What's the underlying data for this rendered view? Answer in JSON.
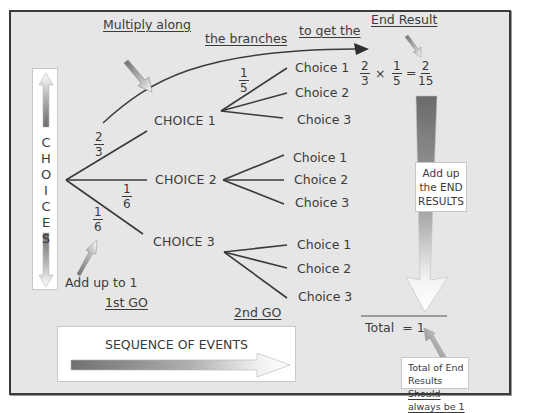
{
  "diagram": {
    "colors": {
      "background": "#e6e6e6",
      "frame": "#3a3a3a",
      "line": "#3a3a3a",
      "box": "#ffffff",
      "arrow_dark": "#6e6e6e"
    },
    "annotations": {
      "multiply_along": "Multiply along",
      "the_branches": "the branches",
      "to_get_the": "to get the",
      "end_result": "End Result",
      "add_up_to_1": "Add up to 1",
      "first_go": "1st GO",
      "second_go": "2nd GO",
      "add_up_end_results": [
        "Add up",
        "the END",
        "RESULTS"
      ],
      "total_label": "Total",
      "total_equals": "=",
      "total_value": "1",
      "total_note_line1": "Total of End Results",
      "total_note_line2": "Should always be 1",
      "sequence_of_events": "SEQUENCE OF EVENTS"
    },
    "choices_box": {
      "letters": [
        "C",
        "H",
        "O",
        "I",
        "C",
        "E",
        "S"
      ]
    },
    "first_level": [
      {
        "label": "CHOICE 1",
        "probability": {
          "num": "2",
          "den": "3"
        },
        "second_level": [
          {
            "label": "Choice 1",
            "probability": {
              "num": "1",
              "den": "5"
            }
          },
          {
            "label": "Choice 2"
          },
          {
            "label": "Choice 3"
          }
        ]
      },
      {
        "label": "CHOICE 2",
        "probability": {
          "num": "1",
          "den": "6"
        },
        "second_level": [
          {
            "label": "Choice 1"
          },
          {
            "label": "Choice 2"
          },
          {
            "label": "Choice 3"
          }
        ]
      },
      {
        "label": "CHOICE 3",
        "probability": {
          "num": "1",
          "den": "6"
        },
        "second_level": [
          {
            "label": "Choice 1"
          },
          {
            "label": "Choice 2"
          },
          {
            "label": "Choice 3"
          }
        ]
      }
    ],
    "formula": {
      "a": {
        "num": "2",
        "den": "3"
      },
      "times": "×",
      "b": {
        "num": "1",
        "den": "5"
      },
      "equals": "=",
      "result": {
        "num": "2",
        "den": "15"
      }
    }
  }
}
